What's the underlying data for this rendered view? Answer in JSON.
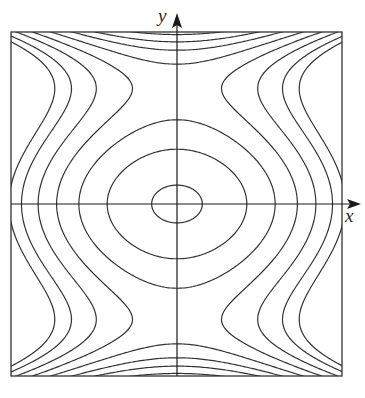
{
  "figure": {
    "type": "contour-plot",
    "axes": {
      "x_label": "x",
      "y_label": "y"
    },
    "frame_px": {
      "left": 11,
      "top": 32,
      "right": 342,
      "bottom": 376
    },
    "origin_px": {
      "x": 177,
      "y": 204
    },
    "colors": {
      "line": "#333333",
      "axis": "#1a1a1a",
      "background": "#ffffff"
    },
    "model": {
      "expression": "f(u,v) = A*u^2 + B*u^4 + v^2 - C*v^4",
      "A": 0.514,
      "B": -0.03,
      "C": 1.11,
      "u_half_range_px": 166,
      "v_half_range_px": 172
    },
    "contour_levels": [
      -0.075,
      0.012,
      0.09,
      0.176,
      0.262,
      0.345,
      0.428,
      0.495
    ]
  }
}
